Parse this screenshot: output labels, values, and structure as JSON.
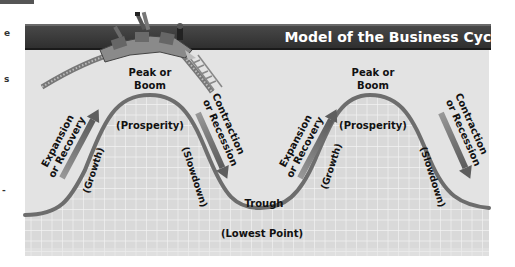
{
  "diagram": {
    "title": "Model of the Business Cycle",
    "colors": {
      "title_bar": "#3d3d3d",
      "title_text": "#ffffff",
      "panel_bg": "#e2e2e2",
      "grid_bg": "#d6d6d6",
      "grid_line": "#f4f4f4",
      "curve": "#6e6e6e",
      "arrow": "#7a7a7a",
      "label_text": "#111111"
    },
    "phases": [
      {
        "id": "expansion-1",
        "label_line1": "Expansion",
        "label_line2": "or Recovery",
        "sublabel": "(Growth)"
      },
      {
        "id": "peak-1",
        "label_line1": "Peak or",
        "label_line2": "Boom",
        "sublabel": "(Prosperity)"
      },
      {
        "id": "contraction-1",
        "label_line1": "Contraction",
        "label_line2": "or Recession",
        "sublabel": "(Slowdown)"
      },
      {
        "id": "trough",
        "label_line1": "Trough",
        "sublabel": "(Lowest Point)"
      },
      {
        "id": "expansion-2",
        "label_line1": "Expansion",
        "label_line2": "or Recovery",
        "sublabel": "(Growth)"
      },
      {
        "id": "peak-2",
        "label_line1": "Peak or",
        "label_line2": "Boom",
        "sublabel": "(Prosperity)"
      },
      {
        "id": "contraction-2",
        "label_line1": "Contraction",
        "label_line2": "or Recession",
        "sublabel": "(Slowdown)"
      }
    ],
    "illustration": "roller-coaster-cresting-peak"
  },
  "left_margin_fragments": [
    "e",
    "s",
    "-"
  ]
}
